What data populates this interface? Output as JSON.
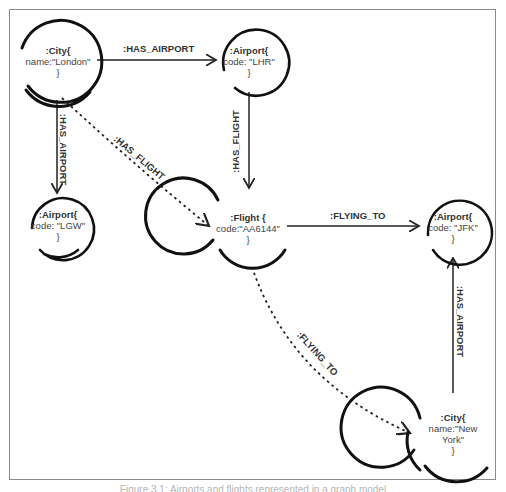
{
  "diagram": {
    "nodes": [
      {
        "id": "london",
        "type": ":City{",
        "props": "name:\"London\"",
        "close": "}"
      },
      {
        "id": "lhr",
        "type": ":Airport{",
        "props": "code: \"LHR\"",
        "close": "}"
      },
      {
        "id": "lgw",
        "type": ":Airport{",
        "props": "code: \"LGW\"",
        "close": "}"
      },
      {
        "id": "flight",
        "type": ":Flight {",
        "props": "code:\"AA6144\"",
        "close": "}"
      },
      {
        "id": "jfk",
        "type": ":Airport{",
        "props": "code: \"JFK\"",
        "close": "}"
      },
      {
        "id": "newyork",
        "type": ":City{",
        "props": "name:\"New",
        "props2": "York\"",
        "close": "}"
      }
    ],
    "edges": [
      {
        "from": "london",
        "to": "lhr",
        "label": ":HAS_AIRPORT",
        "style": "solid"
      },
      {
        "from": "london",
        "to": "lgw",
        "label": ":HAS_AIRPORT",
        "style": "solid"
      },
      {
        "from": "london",
        "to": "flight",
        "label": ":HAS_FLIGHT",
        "style": "dashed"
      },
      {
        "from": "lhr",
        "to": "flight",
        "label": ":HAS_FLIGHT",
        "style": "solid"
      },
      {
        "from": "flight",
        "to": "jfk",
        "label": ":FLYING_TO",
        "style": "solid"
      },
      {
        "from": "flight",
        "to": "newyork",
        "label": ":FLYING_TO",
        "style": "dashed"
      },
      {
        "from": "newyork",
        "to": "jfk",
        "label": ":HAS_AIRPORT",
        "style": "solid"
      }
    ]
  },
  "caption": "Figure 3.1: Airports and flights represented in a graph model"
}
